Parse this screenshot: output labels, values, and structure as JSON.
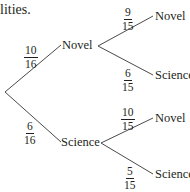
{
  "header_fragment": "lities.",
  "tree": {
    "root": {
      "x": 5,
      "y": 92
    },
    "level1": [
      {
        "label": "Novel",
        "probability": {
          "num": "10",
          "den": "16"
        },
        "children": [
          {
            "label": "Novel",
            "probability": {
              "num": "9",
              "den": "15"
            }
          },
          {
            "label": "Science",
            "probability": {
              "num": "6",
              "den": "15"
            }
          }
        ]
      },
      {
        "label": "Science",
        "probability": {
          "num": "6",
          "den": "16"
        },
        "children": [
          {
            "label": "Novel",
            "probability": {
              "num": "10",
              "den": "15"
            }
          },
          {
            "label": "Science",
            "probability": {
              "num": "5",
              "den": "15"
            }
          }
        ]
      }
    ]
  },
  "colors": {
    "ink": "#231f20",
    "line": "#4a4a4a",
    "background": "#ffffff"
  }
}
